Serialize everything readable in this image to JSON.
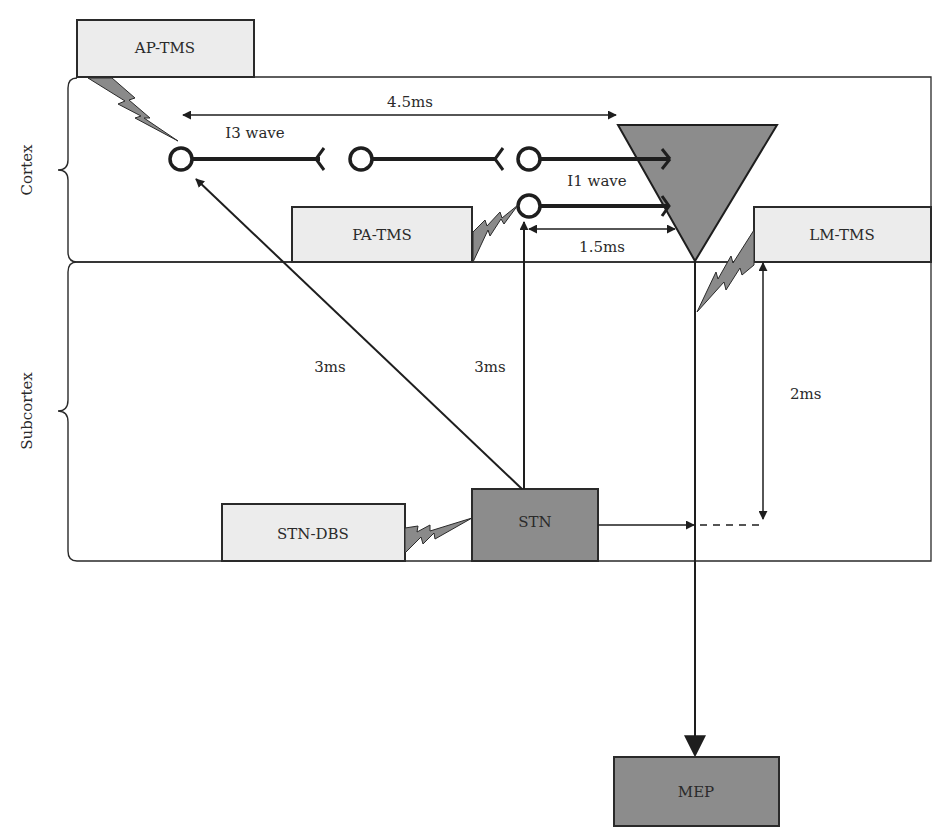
{
  "figure": {
    "regions": {
      "cortex": "Cortex",
      "subcortex": "Subcortex"
    },
    "stimulation_boxes": {
      "ap_tms": "AP-TMS",
      "pa_tms": "PA-TMS",
      "lm_tms": "LM-TMS",
      "stn_dbs": "STN-DBS"
    },
    "nodes": {
      "stn": "STN",
      "mep": "MEP"
    },
    "waves": {
      "i3": "I3 wave",
      "i1": "I1 wave"
    },
    "latencies": {
      "i3_to_pyramidal": "4.5ms",
      "i1_to_pyramidal": "1.5ms",
      "stn_to_i3": "3ms",
      "stn_to_i1": "3ms",
      "lm_to_stn_level": "2ms"
    },
    "colors": {
      "light_box": "#ececec",
      "dark_box": "#8c8c8c",
      "bolt": "#8a8a8a",
      "stroke": "#1e1e1e"
    }
  }
}
